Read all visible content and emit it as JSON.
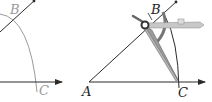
{
  "figure": {
    "left_panel": {
      "labels": {
        "b": "B",
        "c": "C"
      }
    },
    "right_panel": {
      "labels": {
        "a": "A",
        "b": "B",
        "c": "C"
      }
    },
    "colors": {
      "line": "#2a2a2a",
      "arc": "#9a9a9a",
      "label_gray": "#9a9a9a",
      "label_dark": "#222222",
      "compass_body": "#b8b8b8",
      "compass_dark": "#555555"
    }
  }
}
